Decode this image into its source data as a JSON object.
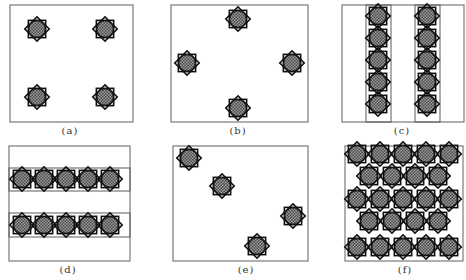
{
  "figure": {
    "colors": {
      "frame": "#7a7a7a",
      "strip": "#5a5a5a",
      "star_stroke": "#111111",
      "star_fill": "#6b6b6b",
      "background": "#ffffff"
    },
    "star_radius": 12,
    "panels": [
      {
        "id": "a",
        "label": "(a)",
        "label_pos": [
          70,
          125
        ],
        "frame": [
          10,
          5,
          123,
          117
        ],
        "strips": [],
        "stars": [
          [
            37,
            29
          ],
          [
            105,
            29
          ],
          [
            37,
            97
          ],
          [
            105,
            97
          ]
        ]
      },
      {
        "id": "b",
        "label": "(b)",
        "label_pos": [
          238,
          125
        ],
        "frame": [
          171,
          5,
          137,
          117
        ],
        "strips": [],
        "stars": [
          [
            238,
            19
          ],
          [
            187,
            63
          ],
          [
            292,
            63
          ],
          [
            238,
            108
          ]
        ]
      },
      {
        "id": "c",
        "label": "(c)",
        "label_pos": [
          402,
          125
        ],
        "frame": [
          342,
          5,
          122,
          117
        ],
        "strips": [
          {
            "orientation": "vertical",
            "rect": [
              366,
              5,
              25,
              117
            ]
          },
          {
            "orientation": "vertical",
            "rect": [
              415,
              5,
              25,
              117
            ]
          }
        ],
        "stars": [
          [
            378,
            16
          ],
          [
            378,
            38
          ],
          [
            378,
            60
          ],
          [
            378,
            82
          ],
          [
            378,
            104
          ],
          [
            427,
            16
          ],
          [
            427,
            38
          ],
          [
            427,
            60
          ],
          [
            427,
            82
          ],
          [
            427,
            104
          ]
        ]
      },
      {
        "id": "d",
        "label": "(d)",
        "label_pos": [
          68,
          264
        ],
        "frame": [
          9,
          146,
          121,
          115
        ],
        "strips": [
          {
            "orientation": "horizontal",
            "rect": [
              9,
              168,
              121,
              23
            ]
          },
          {
            "orientation": "horizontal",
            "rect": [
              9,
              213,
              121,
              24
            ]
          }
        ],
        "stars": [
          [
            22,
            179
          ],
          [
            44,
            179
          ],
          [
            66,
            179
          ],
          [
            88,
            179
          ],
          [
            110,
            179
          ],
          [
            22,
            225
          ],
          [
            44,
            225
          ],
          [
            66,
            225
          ],
          [
            88,
            225
          ],
          [
            110,
            225
          ]
        ]
      },
      {
        "id": "e",
        "label": "(e)",
        "label_pos": [
          246,
          264
        ],
        "frame": [
          173,
          146,
          135,
          115
        ],
        "strips": [],
        "stars": [
          [
            189,
            158
          ],
          [
            222,
            186
          ],
          [
            293,
            216
          ],
          [
            257,
            246
          ]
        ]
      },
      {
        "id": "f",
        "label": "(f)",
        "label_pos": [
          405,
          264
        ],
        "frame": [
          345,
          146,
          118,
          115
        ],
        "strips": [],
        "stars": [
          [
            357,
            154
          ],
          [
            380,
            154
          ],
          [
            403,
            154
          ],
          [
            426,
            154
          ],
          [
            449,
            154
          ],
          [
            369,
            176
          ],
          [
            392,
            176
          ],
          [
            415,
            176
          ],
          [
            438,
            176
          ],
          [
            357,
            199
          ],
          [
            380,
            199
          ],
          [
            403,
            199
          ],
          [
            426,
            199
          ],
          [
            449,
            199
          ],
          [
            369,
            221
          ],
          [
            392,
            221
          ],
          [
            415,
            221
          ],
          [
            438,
            221
          ],
          [
            357,
            247
          ],
          [
            380,
            247
          ],
          [
            403,
            247
          ],
          [
            426,
            247
          ],
          [
            449,
            247
          ]
        ]
      }
    ]
  }
}
